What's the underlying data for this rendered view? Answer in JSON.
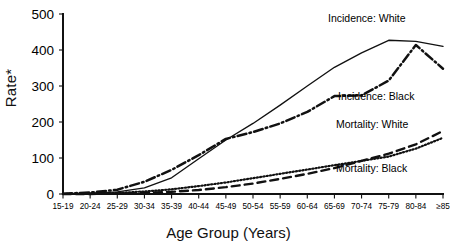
{
  "chart_data": {
    "type": "line",
    "title": "",
    "xlabel": "Age Group (Years)",
    "ylabel": "Rate*",
    "ylim": [
      0,
      500
    ],
    "yticks": [
      0,
      100,
      200,
      300,
      400,
      500
    ],
    "grid": false,
    "legend_position": "inline-right-of-curves",
    "categories": [
      "15-19",
      "20-24",
      "25-29",
      "30-34",
      "35-39",
      "40-44",
      "45-49",
      "50-54",
      "55-59",
      "60-64",
      "65-69",
      "70-74",
      "75-79",
      "80-84",
      "≥85"
    ],
    "series": [
      {
        "name": "Incidence:  White",
        "style": "solid",
        "values": [
          0,
          2,
          6,
          17,
          45,
          98,
          150,
          196,
          247,
          300,
          352,
          392,
          427,
          424,
          410
        ]
      },
      {
        "name": "Incidence:  Black",
        "style": "dash-dot",
        "values": [
          1,
          4,
          12,
          34,
          67,
          108,
          153,
          172,
          196,
          228,
          272,
          274,
          315,
          414,
          348
        ]
      },
      {
        "name": "Mortality:  White",
        "style": "dashed",
        "values": [
          0,
          0,
          1,
          3,
          6,
          11,
          19,
          29,
          42,
          56,
          72,
          92,
          112,
          138,
          175
        ]
      },
      {
        "name": "Mortality:  Black",
        "style": "dotted",
        "values": [
          0,
          1,
          3,
          7,
          13,
          22,
          32,
          44,
          56,
          68,
          80,
          92,
          104,
          126,
          156
        ]
      }
    ],
    "series_labels": [
      {
        "text": "Incidence:  White",
        "x": 328,
        "y": 22
      },
      {
        "text": "Incidence:  Black",
        "x": 338,
        "y": 100
      },
      {
        "text": "Mortality:  White",
        "x": 336,
        "y": 128
      },
      {
        "text": "Mortality:  Black",
        "x": 336,
        "y": 172
      }
    ]
  }
}
